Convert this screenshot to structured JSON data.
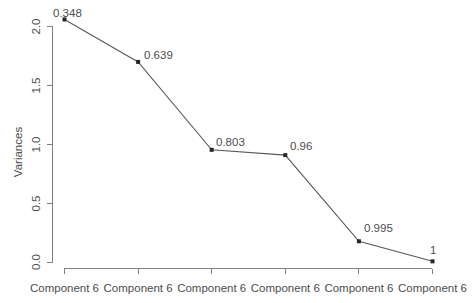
{
  "chart_data": {
    "type": "line",
    "title": "",
    "subtitle": "",
    "xlabel": "",
    "ylabel": "Variances",
    "categories": [
      "Component 6",
      "Component 6",
      "Component 6",
      "Component 6",
      "Component 6",
      "Component 6"
    ],
    "values": [
      2.06,
      1.7,
      0.955,
      0.91,
      0.18,
      0.01
    ],
    "point_labels": [
      "0.348",
      "0.639",
      "0.803",
      "0.96",
      "0.995",
      "1"
    ],
    "ylim": [
      0.0,
      2.1
    ],
    "y_ticks": [
      "0.0",
      "0.5",
      "1.0",
      "1.5",
      "2.0"
    ],
    "y_tick_values": [
      0.0,
      0.5,
      1.0,
      1.5,
      2.0
    ],
    "grid": false,
    "legend": "none",
    "marker": "square",
    "colors": {
      "marker": "#262626",
      "line": "#595959",
      "axis": "#808080",
      "text": "#4d4d4d",
      "background": "#ffffff"
    }
  },
  "axes": {
    "y_axis_title": "Variances"
  }
}
